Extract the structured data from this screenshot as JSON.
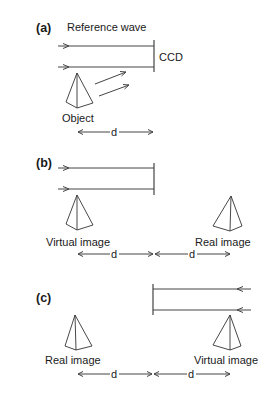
{
  "diagram": {
    "panels": [
      {
        "id": "a",
        "label": "(a)",
        "reference_label": "Reference wave",
        "ccd_label": "CCD",
        "object_label": "Object",
        "distance_label": "d"
      },
      {
        "id": "b",
        "label": "(b)",
        "virtual_label": "Virtual image",
        "real_label": "Real image",
        "distance_labels": [
          "d",
          "d"
        ]
      },
      {
        "id": "c",
        "label": "(c)",
        "real_label": "Real image",
        "virtual_label": "Virtual image",
        "distance_labels": [
          "d",
          "d"
        ]
      }
    ],
    "colors": {
      "line": "#444444",
      "text": "#1a1a1a",
      "background": "#ffffff"
    }
  }
}
